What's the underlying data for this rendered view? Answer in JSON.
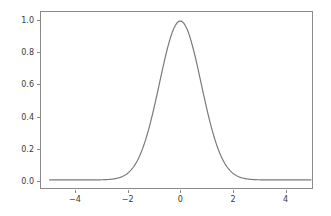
{
  "chart_data": {
    "type": "line",
    "title": "",
    "xlabel": "",
    "ylabel": "",
    "xlim": [
      -5.33,
      5.04
    ],
    "ylim": [
      -0.051,
      1.057
    ],
    "grid": false,
    "legend": null,
    "line_color": "#7a7a7a",
    "line_width": 1.2,
    "background_color": "#ffffff",
    "axes_edge_color": "#8a8a8a",
    "tick_label_color": "#3b3b3b",
    "xticks": [
      {
        "value": -4,
        "label": "−4"
      },
      {
        "value": -2,
        "label": "−2"
      },
      {
        "value": 0,
        "label": "0"
      },
      {
        "value": 2,
        "label": "2"
      },
      {
        "value": 4,
        "label": "4"
      }
    ],
    "yticks": [
      {
        "value": 0.0,
        "label": "0.0"
      },
      {
        "value": 0.2,
        "label": "0.2"
      },
      {
        "value": 0.4,
        "label": "0.4"
      },
      {
        "value": 0.6,
        "label": "0.6"
      },
      {
        "value": 0.8,
        "label": "0.8"
      },
      {
        "value": 1.0,
        "label": "1.0"
      }
    ],
    "series": [
      {
        "name": "gaussian",
        "description": "Gaussian bell curve, amplitude 1.0 centered at x=0 with sigma 0.8",
        "amplitude": 1.0,
        "mean": 0.0,
        "sigma": 0.8,
        "x": [
          -5.0,
          -4.8,
          -4.6,
          -4.4,
          -4.2,
          -4.0,
          -3.8,
          -3.6,
          -3.4,
          -3.2,
          -3.0,
          -2.8,
          -2.6,
          -2.4,
          -2.2,
          -2.0,
          -1.8,
          -1.6,
          -1.4,
          -1.2,
          -1.0,
          -0.9,
          -0.8,
          -0.7,
          -0.6,
          -0.5,
          -0.4,
          -0.3,
          -0.2,
          -0.1,
          0.0,
          0.1,
          0.2,
          0.3,
          0.4,
          0.5,
          0.6,
          0.7,
          0.8,
          0.9,
          1.0,
          1.2,
          1.4,
          1.6,
          1.8,
          2.0,
          2.2,
          2.4,
          2.6,
          2.8,
          3.0,
          3.2,
          3.4,
          3.6,
          3.8,
          4.0,
          4.2,
          4.4,
          4.6,
          4.8,
          5.0
        ],
        "y": [
          0.0,
          0.0,
          0.001,
          0.001,
          0.002,
          0.004,
          0.012,
          0.018,
          0.029,
          0.038,
          0.044,
          0.073,
          0.092,
          0.112,
          0.135,
          0.044,
          0.079,
          0.135,
          0.217,
          0.325,
          0.458,
          0.527,
          0.607,
          0.682,
          0.755,
          0.821,
          0.882,
          0.933,
          0.969,
          0.992,
          1.0,
          0.992,
          0.969,
          0.933,
          0.882,
          0.821,
          0.755,
          0.682,
          0.607,
          0.527,
          0.458,
          0.325,
          0.217,
          0.135,
          0.079,
          0.044,
          0.023,
          0.012,
          0.005,
          0.002,
          0.001,
          0.0,
          0.0,
          0.0,
          0.0,
          0.0,
          0.0,
          0.0,
          0.0,
          0.0,
          0.0
        ]
      }
    ]
  }
}
